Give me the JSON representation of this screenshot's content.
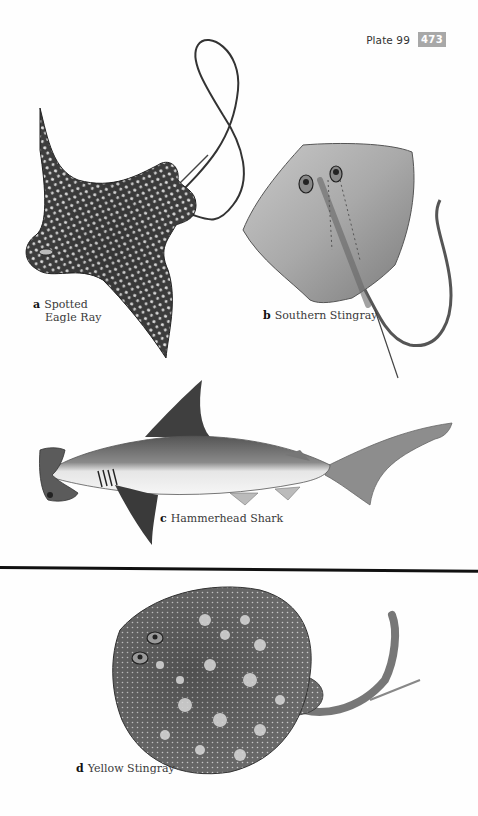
{
  "header": {
    "plate_label": "Plate 99",
    "page_number": "473",
    "page_number_bg": "#a8a8a8"
  },
  "figures": [
    {
      "letter": "a",
      "name_line1": "Spotted",
      "name_line2": "Eagle Ray",
      "illustration": "spotted-eagle-ray-illustration"
    },
    {
      "letter": "b",
      "name": "Southern Stingray",
      "illustration": "southern-stingray-illustration"
    },
    {
      "letter": "c",
      "name": "Hammerhead Shark",
      "illustration": "hammerhead-shark-illustration"
    },
    {
      "letter": "d",
      "name": "Yellow Stingray",
      "illustration": "yellow-stingray-illustration"
    }
  ],
  "colors": {
    "background": "#fefefe",
    "separator": "#111111",
    "caption_text": "#3a3a3a"
  }
}
